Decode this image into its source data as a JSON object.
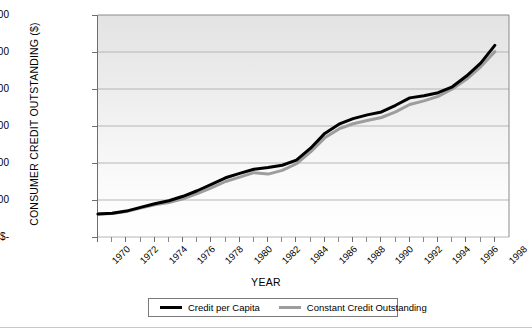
{
  "chart_data": {
    "type": "line",
    "title": "",
    "xlabel": "YEAR",
    "ylabel": "CONSUMER CREDIT OUTSTANDING ($)",
    "xlim": [
      1970,
      1999
    ],
    "ylim": [
      0,
      6000
    ],
    "grid": true,
    "legend_position": "bottom",
    "y_ticks": [
      0,
      1000,
      2000,
      3000,
      4000,
      5000,
      6000
    ],
    "y_tick_labels": [
      "$-",
      "$1 000",
      "$2 000",
      "$3 000",
      "$4 000",
      "$5 000",
      "$6 000"
    ],
    "x_tick_labels": [
      "1970",
      "1972",
      "1974",
      "1976",
      "1978",
      "1980",
      "1982",
      "1984",
      "1986",
      "1988",
      "1990",
      "1992",
      "1994",
      "1996",
      "1998"
    ],
    "x_minor_tick_years": [
      1970,
      1971,
      1972,
      1973,
      1974,
      1975,
      1976,
      1977,
      1978,
      1979,
      1980,
      1981,
      1982,
      1983,
      1984,
      1985,
      1986,
      1987,
      1988,
      1989,
      1990,
      1991,
      1992,
      1993,
      1994,
      1995,
      1996,
      1997,
      1998
    ],
    "x": [
      1970,
      1971,
      1972,
      1973,
      1974,
      1975,
      1976,
      1977,
      1978,
      1979,
      1980,
      1981,
      1982,
      1983,
      1984,
      1985,
      1986,
      1987,
      1988,
      1989,
      1990,
      1991,
      1992,
      1993,
      1994,
      1995,
      1996,
      1997,
      1998
    ],
    "series": [
      {
        "name": "Credit per Capita",
        "color": "#000000",
        "values": [
          620,
          640,
          700,
          800,
          900,
          980,
          1100,
          1250,
          1420,
          1600,
          1720,
          1830,
          1880,
          1940,
          2080,
          2400,
          2800,
          3050,
          3200,
          3300,
          3380,
          3560,
          3760,
          3820,
          3900,
          4060,
          4350,
          4700,
          5180
        ]
      },
      {
        "name": "Constant Credit Outstanding",
        "color": "#9d9d9d",
        "values": [
          620,
          635,
          690,
          780,
          870,
          930,
          1030,
          1170,
          1330,
          1500,
          1620,
          1740,
          1700,
          1800,
          1980,
          2300,
          2680,
          2920,
          3060,
          3150,
          3230,
          3380,
          3580,
          3680,
          3800,
          4000,
          4260,
          4600,
          5010
        ]
      }
    ],
    "legend": [
      {
        "label": "Credit per Capita",
        "color": "#000000"
      },
      {
        "label": "Constant Credit Outstanding",
        "color": "#9d9d9d"
      }
    ]
  },
  "colors": {
    "series_primary": "#000000",
    "series_secondary": "#9d9d9d",
    "gridline": "#b5b5b5",
    "axis": "#6d6d6d",
    "plot_bg_top": "#e3e3e3",
    "plot_bg_bottom": "#ffffff"
  }
}
